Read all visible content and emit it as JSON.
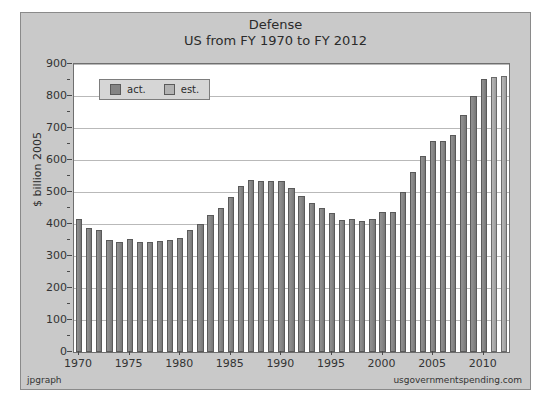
{
  "chart_data": {
    "type": "bar",
    "title": "Defense",
    "subtitle": "US from FY 1970 to FY 2012",
    "xlabel": "",
    "ylabel": "$ billion 2005",
    "ylim": [
      0,
      900
    ],
    "ytick_values": [
      0,
      100,
      200,
      300,
      400,
      500,
      600,
      700,
      800,
      900
    ],
    "ytick_labels": [
      "0",
      "100",
      "200",
      "300",
      "400",
      "500",
      "600",
      "700",
      "800",
      "900"
    ],
    "xtick_labels": [
      "1970",
      "1975",
      "1980",
      "1985",
      "1990",
      "1995",
      "2000",
      "2005",
      "2010"
    ],
    "grid": true,
    "legend_position": "top-left",
    "legend": [
      {
        "key": "act",
        "label": "act.",
        "color": "#848484"
      },
      {
        "key": "est",
        "label": "est.",
        "color": "#b2b2b2"
      }
    ],
    "categories": [
      "1970",
      "1971",
      "1972",
      "1973",
      "1974",
      "1975",
      "1976",
      "1977",
      "1978",
      "1979",
      "1980",
      "1981",
      "1982",
      "1983",
      "1984",
      "1985",
      "1986",
      "1987",
      "1988",
      "1989",
      "1990",
      "1991",
      "1992",
      "1993",
      "1994",
      "1995",
      "1996",
      "1997",
      "1998",
      "1999",
      "2000",
      "2001",
      "2002",
      "2003",
      "2004",
      "2005",
      "2006",
      "2007",
      "2008",
      "2009",
      "2010",
      "2011",
      "2012"
    ],
    "values": [
      415,
      388,
      381,
      350,
      343,
      352,
      345,
      345,
      347,
      350,
      357,
      380,
      400,
      428,
      450,
      483,
      520,
      536,
      534,
      533,
      534,
      511,
      488,
      466,
      451,
      435,
      412,
      416,
      410,
      415,
      436,
      437,
      500,
      562,
      612,
      658,
      660,
      677,
      741,
      800,
      852,
      859,
      862
    ],
    "series_kind": [
      "act",
      "act",
      "act",
      "act",
      "act",
      "act",
      "act",
      "act",
      "act",
      "act",
      "act",
      "act",
      "act",
      "act",
      "act",
      "act",
      "act",
      "act",
      "act",
      "act",
      "act",
      "act",
      "act",
      "act",
      "act",
      "act",
      "act",
      "act",
      "act",
      "act",
      "act",
      "act",
      "act",
      "act",
      "act",
      "act",
      "act",
      "act",
      "act",
      "act",
      "act",
      "est",
      "est"
    ]
  },
  "footer": {
    "left": "jpgraph",
    "right": "usgovernmentspending.com"
  }
}
